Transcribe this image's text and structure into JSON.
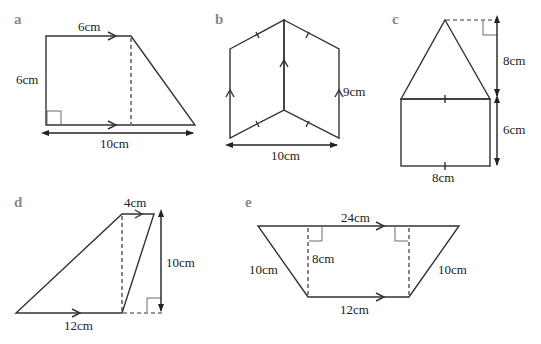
{
  "figure": {
    "shapes": [
      {
        "id": "a",
        "type": "trapezium",
        "labels": {
          "top": "6cm",
          "left": "6cm",
          "bottom": "10cm"
        }
      },
      {
        "id": "b",
        "type": "compound-parallelograms",
        "labels": {
          "right": "9cm",
          "bottom": "10cm"
        }
      },
      {
        "id": "c",
        "type": "triangle-on-rectangle",
        "labels": {
          "triangle_height": "8cm",
          "rectangle_height": "6cm",
          "bottom": "8cm"
        }
      },
      {
        "id": "d",
        "type": "trapezium",
        "labels": {
          "top": "4cm",
          "height": "10cm",
          "bottom": "12cm"
        }
      },
      {
        "id": "e",
        "type": "isosceles-trapezium",
        "labels": {
          "top": "24cm",
          "height": "8cm",
          "left": "10cm",
          "right": "10cm",
          "bottom": "12cm"
        }
      }
    ],
    "colors": {
      "fill_light": "#c8c8c8",
      "fill_dark": "#8c8c8c",
      "stroke": "#333333",
      "letter": "#8a8a8a"
    }
  }
}
